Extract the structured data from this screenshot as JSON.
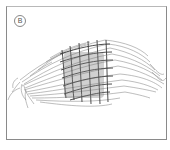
{
  "figure": {
    "label": "B",
    "colors": {
      "border": "#8a8a8a",
      "stroke": "#555555",
      "grid": "#3a3a3a",
      "background": "#ffffff"
    }
  }
}
